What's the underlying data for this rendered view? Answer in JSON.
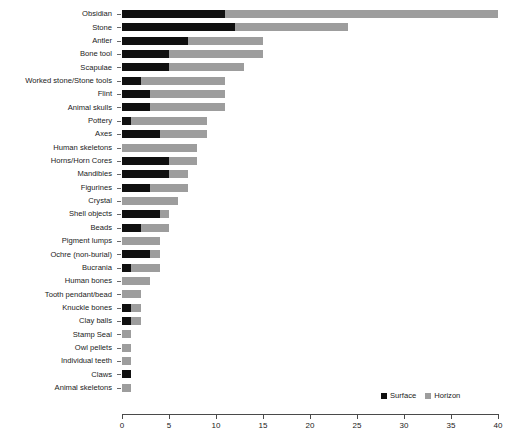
{
  "chart_data": {
    "type": "bar",
    "orientation": "horizontal",
    "stacked": true,
    "title": "",
    "xlabel": "",
    "ylabel": "",
    "xlim": [
      0,
      40
    ],
    "xticks": [
      0,
      5,
      10,
      15,
      20,
      25,
      30,
      35,
      40
    ],
    "xticklabels": [
      "0",
      "5",
      "10",
      "15",
      "20",
      "25",
      "30",
      "35",
      "40"
    ],
    "grid": false,
    "legend_position": "bottom-right",
    "categories": [
      "Obsidian",
      "Stone",
      "Antler",
      "Bone tool",
      "Scapulae",
      "Worked stone/Stone tools",
      "Flint",
      "Animal skulls",
      "Pottery",
      "Axes",
      "Human skeletons",
      "Horns/Horn Cores",
      "Mandibles",
      "Figurines",
      "Crystal",
      "Shell objects",
      "Beads",
      "Pigment lumps",
      "Ochre (non-burial)",
      "Bucrania",
      "Human bones",
      "Tooth pendant/bead",
      "Knuckle bones",
      "Clay balls",
      "Stamp Seal",
      "Owl pellets",
      "Individual teeth",
      "Claws",
      "Animal skeletons"
    ],
    "series": [
      {
        "name": "Surface",
        "color": "#101010",
        "values": [
          11,
          12,
          7,
          5,
          5,
          2,
          3,
          3,
          1,
          4,
          0,
          5,
          5,
          3,
          0,
          4,
          2,
          0,
          3,
          1,
          0,
          0,
          1,
          1,
          0,
          0,
          0,
          1,
          0
        ]
      },
      {
        "name": "Horizon",
        "color": "#9d9d9d",
        "values": [
          29,
          12,
          8,
          10,
          8,
          9,
          8,
          8,
          8,
          5,
          8,
          3,
          2,
          4,
          6,
          1,
          3,
          4,
          1,
          3,
          3,
          2,
          1,
          1,
          1,
          1,
          1,
          0,
          1
        ]
      }
    ],
    "totals": [
      40,
      24,
      15,
      15,
      13,
      11,
      11,
      11,
      9,
      9,
      8,
      8,
      7,
      7,
      6,
      5,
      5,
      4,
      4,
      4,
      3,
      2,
      2,
      2,
      1,
      1,
      1,
      1,
      1
    ]
  },
  "legend": {
    "items": [
      {
        "label": "Surface",
        "color": "#101010"
      },
      {
        "label": "Horizon",
        "color": "#9d9d9d"
      }
    ]
  }
}
